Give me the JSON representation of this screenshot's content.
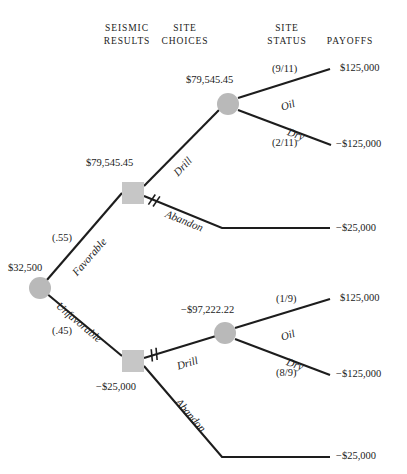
{
  "figure": {
    "background": "#ffffff",
    "node_fill_chance": "#b9b9b9",
    "node_fill_decision": "#c6c6c6",
    "edge_color": "#1d1d1d"
  },
  "headers": [
    {
      "id": "seismic-results",
      "label": "SEISMIC\nRESULTS",
      "x": 72,
      "y": 22,
      "width": 110
    },
    {
      "id": "site-choices",
      "label": "SITE\nCHOICES",
      "x": 130,
      "y": 22,
      "width": 110
    },
    {
      "id": "site-status",
      "label": "SITE\nSTATUS",
      "x": 232,
      "y": 22,
      "width": 110
    },
    {
      "id": "payoffs",
      "label": "PAYOFFS",
      "x": 300,
      "y": 35,
      "width": 100
    }
  ],
  "nodes": [
    {
      "id": "root-chance",
      "type": "chance",
      "cx": 40,
      "cy": 288,
      "r": 11,
      "value": "$32,500",
      "value_x": 8,
      "value_y": 262
    },
    {
      "id": "favorable-decision",
      "type": "decision",
      "x": 122,
      "y": 182,
      "size": 22,
      "value": "$79,545.45",
      "value_x": 86,
      "value_y": 157
    },
    {
      "id": "favorable-drill-chance",
      "type": "chance",
      "cx": 228,
      "cy": 104,
      "r": 11,
      "value": "$79,545.45",
      "value_x": 186,
      "value_y": 74
    },
    {
      "id": "unfavorable-decision",
      "type": "decision",
      "x": 122,
      "y": 350,
      "size": 22,
      "value": "-$25,000",
      "value_x": 96,
      "value_y": 381
    },
    {
      "id": "unfavorable-drill-chance",
      "type": "chance",
      "cx": 225,
      "cy": 333,
      "r": 11,
      "value": "-$97,222.22",
      "value_x": 181,
      "value_y": 304
    }
  ],
  "edges": [
    {
      "id": "edge-favorable",
      "points": "40,288 122,193",
      "pruned": false
    },
    {
      "id": "edge-unfavorable",
      "points": "40,288 122,356",
      "pruned": false
    },
    {
      "id": "edge-favorable-drill",
      "points": "144,186 219,110",
      "pruned": false
    },
    {
      "id": "edge-favorable-abandon",
      "points": "144,196 222,228 330,228",
      "pruned": true,
      "prune_x": 153,
      "prune_y": 200
    },
    {
      "id": "edge-oil-top",
      "points": "238,98 330,69",
      "pruned": false
    },
    {
      "id": "edge-dry-top",
      "points": "238,110 331,145",
      "pruned": false
    },
    {
      "id": "edge-unfavorable-drill",
      "points": "144,358 216,336",
      "pruned": true,
      "prune_x": 153,
      "prune_y": 355
    },
    {
      "id": "edge-unfavorable-abandon",
      "points": "144,366 222,457 330,457",
      "pruned": false
    },
    {
      "id": "edge-oil-bottom",
      "points": "235,328 330,299",
      "pruned": false
    },
    {
      "id": "edge-dry-bottom",
      "points": "235,339 330,375",
      "pruned": false
    }
  ],
  "branch_labels": [
    {
      "id": "label-favorable",
      "text": "Favorable",
      "x": 74,
      "y": 268,
      "rotate": -49
    },
    {
      "id": "label-unfavorable",
      "text": "Unfavorable",
      "x": 58,
      "y": 298,
      "rotate": 40
    },
    {
      "id": "label-drill-top",
      "text": "Drill",
      "x": 175,
      "y": 168,
      "rotate": -46
    },
    {
      "id": "label-abandon-top",
      "text": "Abandon",
      "x": 166,
      "y": 207,
      "rotate": 22
    },
    {
      "id": "label-oil-top",
      "text": "Oil",
      "x": 281,
      "y": 101,
      "rotate": -18
    },
    {
      "id": "label-dry-top",
      "text": "Dry",
      "x": 288,
      "y": 125,
      "rotate": 21
    },
    {
      "id": "label-drill-bottom",
      "text": "Drill",
      "x": 177,
      "y": 360,
      "rotate": -17
    },
    {
      "id": "label-abandon-bottom",
      "text": "Abandon",
      "x": 178,
      "y": 394,
      "rotate": 49
    },
    {
      "id": "label-oil-bottom",
      "text": "Oil",
      "x": 281,
      "y": 331,
      "rotate": -18
    },
    {
      "id": "label-dry-bottom",
      "text": "Dry",
      "x": 287,
      "y": 355,
      "rotate": 21
    }
  ],
  "probabilities": [
    {
      "id": "prob-favorable",
      "text": "(.55)",
      "x": 52,
      "y": 232
    },
    {
      "id": "prob-unfavorable",
      "text": "(.45)",
      "x": 52,
      "y": 325
    },
    {
      "id": "prob-oil-top",
      "text": "(9/11)",
      "x": 272,
      "y": 63
    },
    {
      "id": "prob-dry-top",
      "text": "(2/11)",
      "x": 272,
      "y": 137
    },
    {
      "id": "prob-oil-bottom",
      "text": "(1/9)",
      "x": 276,
      "y": 293
    },
    {
      "id": "prob-dry-bottom",
      "text": "(8/9)",
      "x": 276,
      "y": 367
    }
  ],
  "payoffs": [
    {
      "id": "payoff-oil-top",
      "text": "$125,000",
      "x": 340,
      "y": 62
    },
    {
      "id": "payoff-dry-top",
      "text": "-$125,000",
      "x": 336,
      "y": 138
    },
    {
      "id": "payoff-abandon-top",
      "text": "-$25,000",
      "x": 336,
      "y": 222
    },
    {
      "id": "payoff-oil-bottom",
      "text": "$125,000",
      "x": 340,
      "y": 292
    },
    {
      "id": "payoff-dry-bottom",
      "text": "-$125,000",
      "x": 336,
      "y": 368
    },
    {
      "id": "payoff-abandon-bottom",
      "text": "-$25,000",
      "x": 336,
      "y": 450
    }
  ],
  "chart_data": {
    "type": "diagram",
    "diagram_kind": "decision-tree",
    "stages": [
      "SEISMIC RESULTS",
      "SITE CHOICES",
      "SITE STATUS",
      "PAYOFFS"
    ],
    "root": {
      "node": "chance",
      "expected_value": "$32,500",
      "branches": [
        {
          "label": "Favorable",
          "probability": "(.55)",
          "child": {
            "node": "decision",
            "expected_value": "$79,545.45",
            "branches": [
              {
                "label": "Drill",
                "pruned": false,
                "child": {
                  "node": "chance",
                  "expected_value": "$79,545.45",
                  "branches": [
                    {
                      "label": "Oil",
                      "probability": "(9/11)",
                      "payoff": "$125,000"
                    },
                    {
                      "label": "Dry",
                      "probability": "(2/11)",
                      "payoff": "-$125,000"
                    }
                  ]
                }
              },
              {
                "label": "Abandon",
                "pruned": true,
                "payoff": "-$25,000"
              }
            ]
          }
        },
        {
          "label": "Unfavorable",
          "probability": "(.45)",
          "child": {
            "node": "decision",
            "expected_value": "-$25,000",
            "branches": [
              {
                "label": "Drill",
                "pruned": true,
                "child": {
                  "node": "chance",
                  "expected_value": "-$97,222.22",
                  "branches": [
                    {
                      "label": "Oil",
                      "probability": "(1/9)",
                      "payoff": "$125,000"
                    },
                    {
                      "label": "Dry",
                      "probability": "(8/9)",
                      "payoff": "-$125,000"
                    }
                  ]
                }
              },
              {
                "label": "Abandon",
                "pruned": false,
                "payoff": "-$25,000"
              }
            ]
          }
        }
      ]
    }
  }
}
